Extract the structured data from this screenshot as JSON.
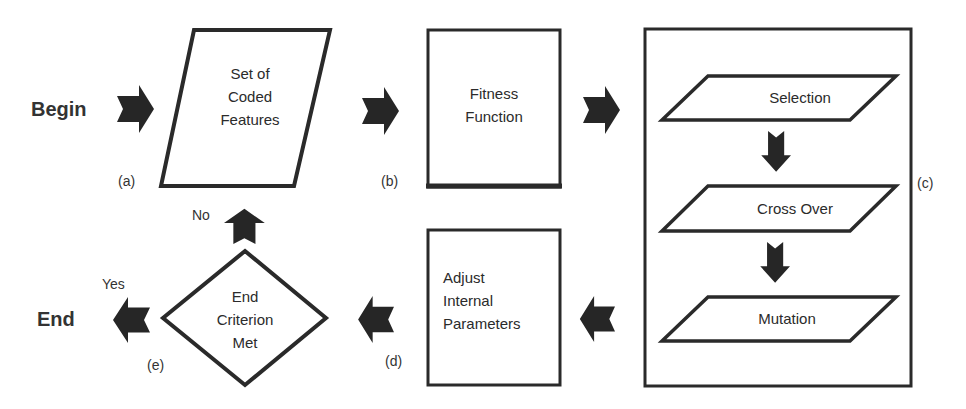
{
  "diagram": {
    "type": "flowchart",
    "terminals": {
      "begin": "Begin",
      "end": "End"
    },
    "nodes": {
      "coded_features": {
        "shape": "parallelogram",
        "lines": [
          "Set of",
          "Coded",
          "Features"
        ],
        "tag": "(a)"
      },
      "fitness": {
        "shape": "rectangle",
        "lines": [
          "Fitness",
          "Function"
        ],
        "tag": "(b)"
      },
      "ga_operators": {
        "shape": "rectangle-group",
        "tag": "(c)",
        "steps": [
          {
            "label": "Selection"
          },
          {
            "label": "Cross Over"
          },
          {
            "label": "Mutation"
          }
        ]
      },
      "adjust": {
        "shape": "rectangle",
        "lines": [
          "Adjust",
          "Internal",
          "Parameters"
        ],
        "tag": "(d)"
      },
      "end_criterion": {
        "shape": "diamond",
        "lines": [
          "End",
          "Criterion",
          "Met"
        ],
        "tag": "(e)"
      }
    },
    "branches": {
      "yes": "Yes",
      "no": "No"
    },
    "edges": [
      {
        "from": "begin",
        "to": "coded_features",
        "icon": "arrow-right-icon"
      },
      {
        "from": "coded_features",
        "to": "fitness",
        "icon": "arrow-right-icon"
      },
      {
        "from": "fitness",
        "to": "ga_operators",
        "icon": "arrow-right-icon"
      },
      {
        "from": "selection",
        "to": "cross_over",
        "icon": "arrow-down-icon"
      },
      {
        "from": "cross_over",
        "to": "mutation",
        "icon": "arrow-down-icon"
      },
      {
        "from": "ga_operators",
        "to": "adjust",
        "icon": "arrow-left-icon"
      },
      {
        "from": "adjust",
        "to": "end_criterion",
        "icon": "arrow-left-icon"
      },
      {
        "from": "end_criterion",
        "to": "coded_features",
        "label": "No",
        "icon": "arrow-up-icon"
      },
      {
        "from": "end_criterion",
        "to": "end",
        "label": "Yes",
        "icon": "arrow-left-icon"
      }
    ],
    "colors": {
      "stroke": "#2a2a2a",
      "arrow_fill": "#262626",
      "background": "#ffffff",
      "text": "#2b2b2b"
    }
  }
}
